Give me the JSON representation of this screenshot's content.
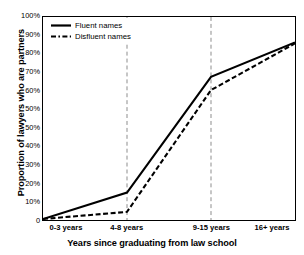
{
  "chart_data": {
    "type": "line",
    "title": "",
    "xlabel": "Years since graduating from law school",
    "ylabel": "Proportion of lawyers who are partners",
    "categories": [
      "0-3 years",
      "4-8 years",
      "9-15 years",
      "16+ years"
    ],
    "ylim": [
      0,
      100
    ],
    "grid": "vertical dashed gridlines at categories 2 and 3",
    "legend_position": "top-left inside plot area",
    "ytick_labels": [
      "100%",
      "90%",
      "80%",
      "70%",
      "60%",
      "50%",
      "50%",
      "40%",
      "30%",
      "20%",
      "10%",
      "0"
    ],
    "ytick_values": [
      100,
      90,
      80,
      70,
      60,
      50,
      45,
      40,
      30,
      20,
      10,
      0
    ],
    "series": [
      {
        "name": "Fluent names",
        "style": "solid",
        "color": "#000000",
        "values": [
          0.5,
          13.5,
          70.5,
          87.5
        ]
      },
      {
        "name": "Disfluent names",
        "style": "dashed",
        "color": "#000000",
        "values": [
          0.5,
          4,
          64,
          87
        ]
      }
    ]
  },
  "legend": {
    "items": [
      {
        "label": "Fluent names",
        "swatch": "solid-line-swatch"
      },
      {
        "label": "Disfluent names",
        "swatch": "dashed-line-swatch"
      }
    ]
  }
}
